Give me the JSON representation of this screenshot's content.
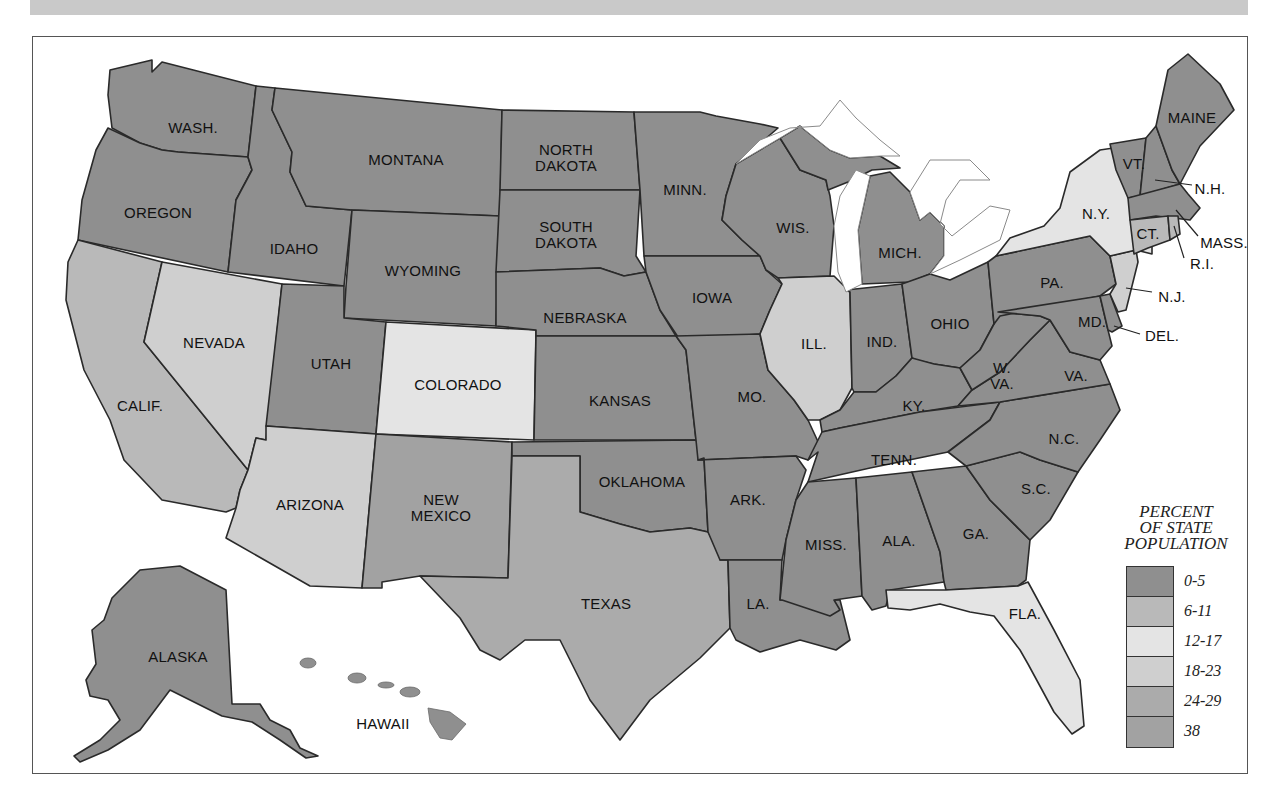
{
  "map": {
    "title": "",
    "legend": {
      "title_lines": [
        "PERCENT",
        "OF STATE",
        "POPULATION"
      ],
      "classes": [
        {
          "label": "0-5",
          "color": "#8f8f8f"
        },
        {
          "label": "6-11",
          "color": "#b9b9b9"
        },
        {
          "label": "12-17",
          "color": "#e4e4e4"
        },
        {
          "label": "18-23",
          "color": "#cfcfcf"
        },
        {
          "label": "24-29",
          "color": "#ababab"
        },
        {
          "label": "38",
          "color": "#a2a2a2"
        }
      ]
    },
    "states": {
      "wash": "WASH.",
      "oregon": "OREGON",
      "calif": "CALIF.",
      "idaho": "IDAHO",
      "nevada": "NEVADA",
      "montana": "MONTANA",
      "wyoming": "WYOMING",
      "utah": "UTAH",
      "colorado": "COLORADO",
      "arizona": "ARIZONA",
      "new_mexico_1": "NEW",
      "new_mexico_2": "MEXICO",
      "north_dakota_1": "NORTH",
      "north_dakota_2": "DAKOTA",
      "south_dakota_1": "SOUTH",
      "south_dakota_2": "DAKOTA",
      "nebraska": "NEBRASKA",
      "kansas": "KANSAS",
      "oklahoma": "OKLAHOMA",
      "texas": "TEXAS",
      "minn": "MINN.",
      "iowa": "IOWA",
      "mo": "MO.",
      "ark": "ARK.",
      "la": "LA.",
      "wis": "WIS.",
      "ill": "ILL.",
      "mich": "MICH.",
      "ind": "IND.",
      "ohio": "OHIO",
      "ky": "KY.",
      "tenn": "TENN.",
      "miss": "MISS.",
      "ala": "ALA.",
      "ga": "GA.",
      "fla": "FLA.",
      "sc": "S.C.",
      "nc": "N.C.",
      "va": "VA.",
      "wva_1": "W.",
      "wva_2": "VA.",
      "pa": "PA.",
      "ny": "N.Y.",
      "vt": "VT.",
      "nh": "N.H.",
      "maine": "MAINE",
      "mass": "MASS.",
      "ri": "R.I.",
      "ct": "CT.",
      "nj": "N.J.",
      "del": "DEL.",
      "md": "MD.",
      "alaska": "ALASKA",
      "hawaii": "HAWAII"
    },
    "state_classes": {
      "WASH.": "0-5",
      "OREGON": "0-5",
      "CALIF.": "6-11",
      "IDAHO": "0-5",
      "NEVADA": "18-23",
      "MONTANA": "0-5",
      "WYOMING": "0-5",
      "UTAH": "0-5",
      "COLORADO": "12-17",
      "ARIZONA": "18-23",
      "NEW MEXICO": "38",
      "NORTH DAKOTA": "0-5",
      "SOUTH DAKOTA": "0-5",
      "NEBRASKA": "0-5",
      "KANSAS": "0-5",
      "OKLAHOMA": "0-5",
      "TEXAS": "24-29",
      "MINN.": "0-5",
      "IOWA": "0-5",
      "MO.": "0-5",
      "ARK.": "0-5",
      "LA.": "0-5",
      "WIS.": "0-5",
      "ILL.": "6-11",
      "MICH.": "0-5",
      "IND.": "0-5",
      "OHIO": "0-5",
      "KY.": "0-5",
      "TENN.": "0-5",
      "MISS.": "0-5",
      "ALA.": "0-5",
      "GA.": "0-5",
      "FLA.": "12-17",
      "S.C.": "0-5",
      "N.C.": "0-5",
      "VA.": "0-5",
      "W. VA.": "0-5",
      "PA.": "0-5",
      "N.Y.": "12-17",
      "VT.": "0-5",
      "N.H.": "0-5",
      "MAINE": "0-5",
      "MASS.": "0-5",
      "R.I.": "6-11",
      "CT.": "6-11",
      "N.J.": "12-17",
      "DEL.": "0-5",
      "MD.": "0-5",
      "ALASKA": "0-5",
      "HAWAII": "0-5"
    }
  }
}
